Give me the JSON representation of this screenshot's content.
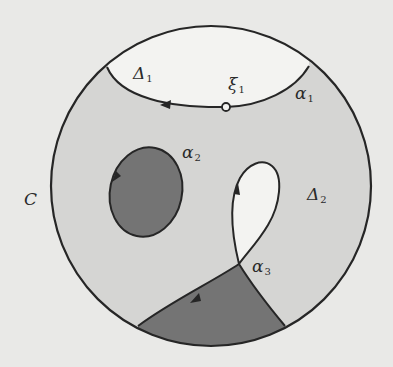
{
  "diagram": {
    "colors": {
      "paper": "#e9e9e7",
      "light_region": "#d5d5d3",
      "dark_region": "#747474",
      "white_region": "#f3f3f1",
      "stroke": "#262626"
    },
    "labels": {
      "C": {
        "base": "C",
        "sub": ""
      },
      "Delta1": {
        "base": "Δ",
        "sub": "1"
      },
      "Delta2": {
        "base": "Δ",
        "sub": "2"
      },
      "xi1": {
        "base": "ξ",
        "sub": "1"
      },
      "alpha1": {
        "base": "α",
        "sub": "1"
      },
      "alpha2": {
        "base": "α",
        "sub": "2"
      },
      "alpha3": {
        "base": "α",
        "sub": "3"
      }
    },
    "elements": [
      {
        "name": "C",
        "kind": "outer-circle"
      },
      {
        "name": "α1",
        "kind": "curve-with-left-arrow",
        "region": "Δ1 (unshaded)"
      },
      {
        "name": "ξ1",
        "kind": "open-point-on-α1"
      },
      {
        "name": "α2",
        "kind": "closed-curve-dark-shaded"
      },
      {
        "name": "α3",
        "kind": "self-crossing-curve-with-loop",
        "region": "dark-shaded segment at bottom"
      },
      {
        "name": "Δ2",
        "kind": "light-shaded region"
      }
    ]
  }
}
